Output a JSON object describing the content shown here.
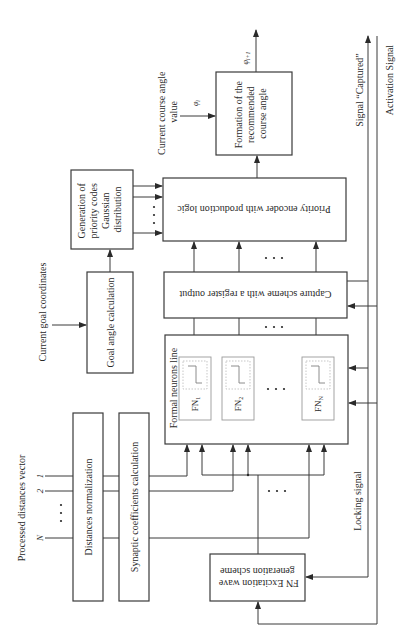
{
  "diagram": {
    "blocks": {
      "formation": {
        "lines": [
          "Formation of the",
          "recommended",
          "course angle"
        ]
      },
      "priority_encoder": {
        "label": "Priority encoder with production logic"
      },
      "generation": {
        "lines": [
          "Generation of",
          "priority codes",
          "Gaussian",
          "distribution"
        ]
      },
      "capture": {
        "label": "Capture scheme with a register output"
      },
      "goal_angle": {
        "label": "Goal angle calculation"
      },
      "neurons_line": {
        "label": "Formal neurons line",
        "cells": [
          {
            "name": "FN",
            "sub": "1"
          },
          {
            "name": "FN",
            "sub": "2"
          },
          {
            "name": "FN",
            "sub": "N"
          }
        ],
        "ellipsis": "· · ·"
      },
      "distances_norm": {
        "label": "Distances normalization"
      },
      "synaptic": {
        "label": "Synaptic coefficients calculation"
      },
      "fn_excitation": {
        "lines": [
          "FN Excitation wave",
          "generation scheme"
        ]
      }
    },
    "signals": {
      "current_course_angle": {
        "lines": [
          "Current course angle",
          "value"
        ],
        "symbol": "φ",
        "sub": "i"
      },
      "output_angle": {
        "symbol": "φ",
        "sub": "i+1"
      },
      "current_goal_coords": "Current goal coordinates",
      "processed_distances": "Processed distances vector",
      "inputs": [
        "1",
        "2",
        "N"
      ],
      "captured": "Signal “Captured”",
      "activation": "Activation Signal",
      "locking": "Locking signal"
    }
  }
}
